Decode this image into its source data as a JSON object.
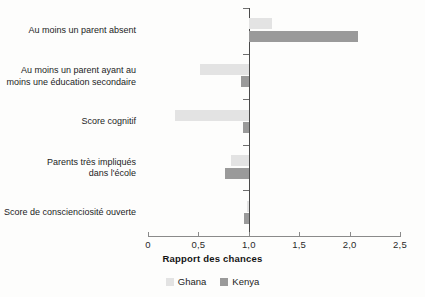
{
  "chart_data": {
    "type": "bar",
    "orientation": "horizontal",
    "title": "",
    "xlabel": "Rapport des chances",
    "ylabel": "",
    "xlim": [
      0,
      2.5
    ],
    "reference_line": 1.0,
    "grid": false,
    "legend_position": "bottom-center",
    "xticks": [
      {
        "value": 0,
        "label": "0"
      },
      {
        "value": 0.5,
        "label": "0,5"
      },
      {
        "value": 1.0,
        "label": "1,0"
      },
      {
        "value": 1.5,
        "label": "1,5"
      },
      {
        "value": 2.0,
        "label": "2,0"
      },
      {
        "value": 2.5,
        "label": "2,5"
      }
    ],
    "categories": [
      "Au moins un parent absent",
      "Au moins un parent ayant au moins une éducation secondaire",
      "Score cognitif",
      "Parents très impliqués dans l'école",
      "Score de conscienciosité ouverte"
    ],
    "category_labels": [
      [
        "Au moins un parent absent"
      ],
      [
        "Au moins un parent ayant au",
        "moins une éducation secondaire"
      ],
      [
        "Score cognitif"
      ],
      [
        "Parents très impliqués",
        "dans l'école"
      ],
      [
        "Score de conscienciosité ouverte"
      ]
    ],
    "series": [
      {
        "name": "Ghana",
        "color": "#e3e3e3",
        "values": [
          1.23,
          0.52,
          0.27,
          0.82,
          0.98
        ]
      },
      {
        "name": "Kenya",
        "color": "#9a9a9a",
        "values": [
          2.08,
          0.92,
          0.94,
          0.76,
          0.95
        ]
      }
    ]
  },
  "legend": {
    "items": [
      {
        "label": "Ghana",
        "color": "#e3e3e3"
      },
      {
        "label": "Kenya",
        "color": "#9a9a9a"
      }
    ]
  },
  "axis": {
    "x_title": "Rapport des chances"
  }
}
